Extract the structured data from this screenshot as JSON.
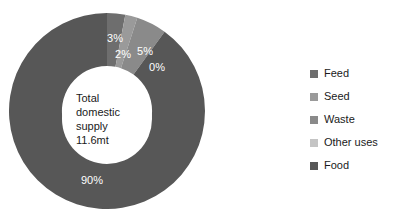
{
  "chart_data": {
    "type": "pie",
    "variant": "doughnut",
    "title": "",
    "subtitle": "",
    "xlabel": "",
    "ylabel": "",
    "grid": false,
    "start_angle_deg": 0,
    "direction": "clockwise",
    "inner_radius_ratio": 0.46,
    "legend_position": "right",
    "center_label": {
      "lines": [
        "Total",
        "domestic",
        "supply",
        "11.6mt"
      ],
      "text": "Total domestic supply 11.6mt",
      "value": "11.6",
      "unit": "mt"
    },
    "categories": [
      "Feed",
      "Seed",
      "Waste",
      "Other uses",
      "Food"
    ],
    "values": [
      3,
      2,
      5,
      0,
      90
    ],
    "value_labels": [
      "3%",
      "2%",
      "5%",
      "0%",
      "90%"
    ],
    "colors": [
      "#6e6e6e",
      "#9a9a9a",
      "#8a8a8a",
      "#c4c4c4",
      "#575757"
    ],
    "slices": [
      {
        "name": "Feed",
        "value": 3,
        "label": "3%",
        "color": "#6e6e6e",
        "label_x": 106,
        "label_y": 29,
        "label_anchor": "middle"
      },
      {
        "name": "Seed",
        "value": 2,
        "label": "2%",
        "color": "#9a9a9a",
        "label_x": 114,
        "label_y": 45,
        "label_anchor": "middle"
      },
      {
        "name": "Waste",
        "value": 5,
        "label": "5%",
        "color": "#8a8a8a",
        "label_x": 136,
        "label_y": 42,
        "label_anchor": "middle"
      },
      {
        "name": "Other uses",
        "value": 0,
        "label": "0%",
        "color": "#c4c4c4",
        "label_x": 148,
        "label_y": 58,
        "label_anchor": "middle"
      },
      {
        "name": "Food",
        "value": 90,
        "label": "90%",
        "color": "#575757",
        "label_x": 83,
        "label_y": 171,
        "label_anchor": "middle"
      }
    ]
  },
  "legend": {
    "items": [
      {
        "label": "Feed",
        "color": "#6e6e6e"
      },
      {
        "label": "Seed",
        "color": "#9a9a9a"
      },
      {
        "label": "Waste",
        "color": "#8a8a8a"
      },
      {
        "label": "Other uses",
        "color": "#c4c4c4"
      },
      {
        "label": "Food",
        "color": "#575757"
      }
    ]
  }
}
